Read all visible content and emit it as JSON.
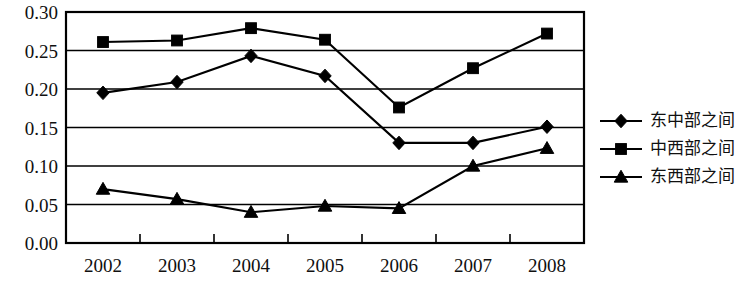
{
  "chart_data": {
    "type": "line",
    "title": "",
    "subtitle": "",
    "xlabel": "",
    "ylabel": "",
    "categories": [
      "2002",
      "2003",
      "2004",
      "2005",
      "2006",
      "2007",
      "2008"
    ],
    "ylim": [
      0.0,
      0.3
    ],
    "ytick_labels": [
      "0.30",
      "0.25",
      "0.20",
      "0.15",
      "0.10",
      "0.05",
      "0.00"
    ],
    "ytick_values": [
      0.3,
      0.25,
      0.2,
      0.15,
      0.1,
      0.05,
      0.0
    ],
    "grid": true,
    "legend_position": "right",
    "series": [
      {
        "name": "东中部之间",
        "marker": "diamond",
        "color": "#000000",
        "values": [
          0.195,
          0.209,
          0.243,
          0.217,
          0.13,
          0.13,
          0.151
        ]
      },
      {
        "name": "中西部之间",
        "marker": "square",
        "color": "#000000",
        "values": [
          0.261,
          0.263,
          0.279,
          0.264,
          0.176,
          0.227,
          0.272
        ]
      },
      {
        "name": "东西部之间",
        "marker": "triangle",
        "color": "#000000",
        "values": [
          0.07,
          0.057,
          0.04,
          0.048,
          0.045,
          0.1,
          0.123
        ]
      }
    ]
  },
  "legend": {
    "items": [
      {
        "label": "东中部之间",
        "marker": "diamond"
      },
      {
        "label": "中西部之间",
        "marker": "square"
      },
      {
        "label": "东西部之间",
        "marker": "triangle"
      }
    ]
  }
}
